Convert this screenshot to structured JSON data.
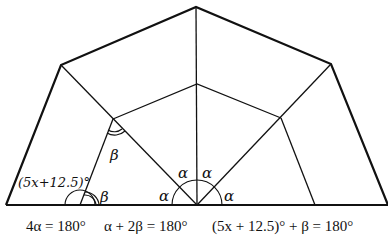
{
  "diagram": {
    "type": "geometry-half-polygon",
    "colors": {
      "stroke": "#111111",
      "background": "#ffffff"
    },
    "vertices": {
      "bottom_left": [
        6,
        205
      ],
      "outer_left": [
        61,
        65
      ],
      "top": [
        196,
        7
      ],
      "outer_right": [
        331,
        64
      ],
      "bottom_right": [
        388,
        205
      ],
      "inner_left": [
        113,
        119
      ],
      "inner_top": [
        197,
        84
      ],
      "inner_right": [
        281,
        118
      ],
      "center_bottom": [
        197,
        205
      ],
      "left_leg_bottom": [
        80,
        205
      ],
      "right_leg_bottom": [
        315,
        205
      ]
    },
    "labels": {
      "alpha": "α",
      "beta": "β",
      "beta_inner": "β",
      "expression": "(5x+12.5)°"
    },
    "equations": [
      "4α = 180°",
      "α + 2β = 180°",
      "(5x + 12.5)° + β = 180°"
    ]
  }
}
